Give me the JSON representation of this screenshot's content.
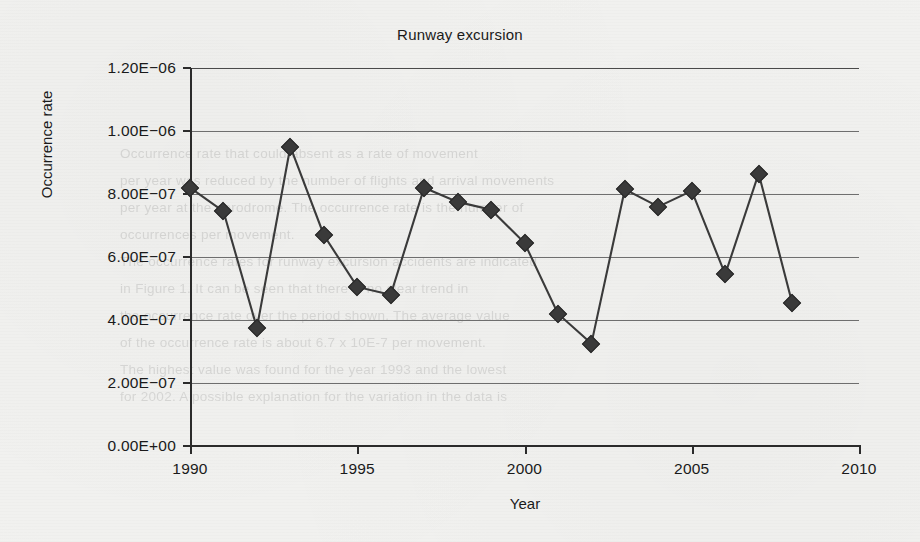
{
  "chart_data": {
    "type": "line",
    "title": "Runway excursion",
    "xlabel": "Year",
    "ylabel": "Occurrence rate",
    "x": [
      1990,
      1991,
      1992,
      1993,
      1994,
      1995,
      1996,
      1997,
      1998,
      1999,
      2000,
      2001,
      2002,
      2003,
      2004,
      2005,
      2006,
      2007,
      2008
    ],
    "values": [
      8.2e-07,
      7.45e-07,
      3.75e-07,
      9.5e-07,
      6.7e-07,
      5.05e-07,
      4.8e-07,
      8.2e-07,
      7.75e-07,
      7.5e-07,
      6.45e-07,
      4.2e-07,
      3.25e-07,
      8.15e-07,
      7.6e-07,
      8.1e-07,
      5.45e-07,
      8.65e-07,
      4.55e-07
    ],
    "xlim": [
      1990,
      2010
    ],
    "ylim": [
      0,
      1.2e-06
    ],
    "xticks": [
      1990,
      1995,
      2000,
      2005,
      2010
    ],
    "xtick_labels": [
      "1990",
      "1995",
      "2000",
      "2005",
      "2010"
    ],
    "yticks": [
      0,
      2e-07,
      4e-07,
      6e-07,
      8e-07,
      1e-06,
      1.2e-06
    ],
    "ytick_labels": [
      "0.00E+00",
      "2.00E−07",
      "4.00E−07",
      "6.00E−07",
      "8.00E−07",
      "1.00E−06",
      "1.20E−06"
    ],
    "grid": "horizontal",
    "legend": "none",
    "marker": "diamond",
    "series_color": "#3a3a3a"
  },
  "background": {
    "bleed_text": "Occurrence rate that could absent as a rate of movement\nper year was reduced by the number of flights and arrival movements\nper year at the aerodrome. The occurrence rate is the number of\noccurrences per movement.\nThe occurrence rates for runway excursion accidents are indicated\nin Figure 1. It can be seen that there is no clear trend in\nthe occurrence rate over the period shown. The average value\nof the occurrence rate is about 6.7 x 10E-7 per movement.\nThe highest value was found for the year 1993 and the lowest\nfor 2002. A possible explanation for the variation in the data is"
  }
}
